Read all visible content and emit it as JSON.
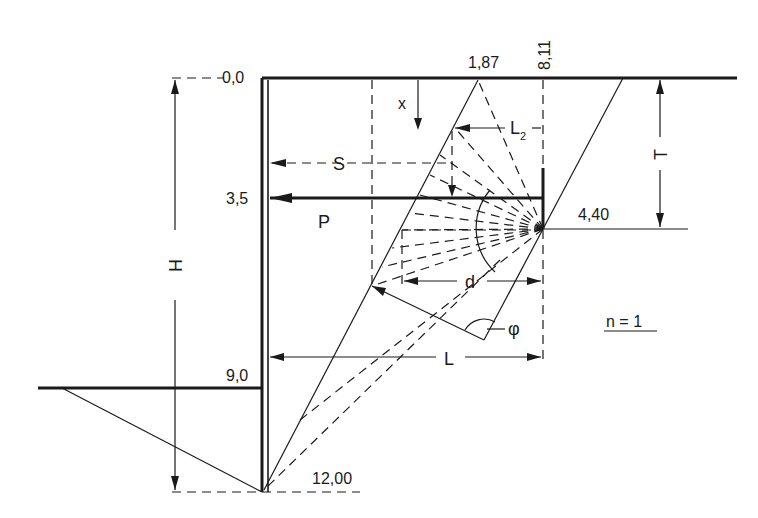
{
  "diagram": {
    "parameter": "n = 1",
    "depth_labels": {
      "top": "0,0",
      "anchor": "3,5",
      "excavation": "9,0",
      "toe": "12,00"
    },
    "top_labels": {
      "wedge_top": "1,87",
      "anchor_plate_x": "8,11"
    },
    "anchor_depth_label": "4,40",
    "symbols": {
      "x": "x",
      "S": "S",
      "P": "P",
      "L2": "L",
      "L2_sub": "2",
      "T": "T",
      "H": "H",
      "d": "d",
      "L": "L",
      "phi": "φ"
    },
    "colors": {
      "line": "#1a1a1a",
      "background": "#ffffff"
    }
  }
}
